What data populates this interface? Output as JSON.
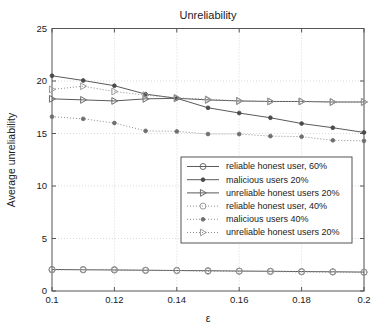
{
  "chart_data": {
    "type": "line",
    "title": "Unreliability",
    "xlabel": "ε",
    "ylabel": "Average unreliability",
    "xlim": [
      0.1,
      0.2
    ],
    "ylim": [
      0,
      25
    ],
    "grid": true,
    "legend_position": "center-right",
    "x": [
      0.1,
      0.11,
      0.12,
      0.13,
      0.14,
      0.15,
      0.16,
      0.17,
      0.18,
      0.19,
      0.2
    ],
    "xticks": [
      "0.1",
      "0.12",
      "0.14",
      "0.16",
      "0.18",
      "0.2"
    ],
    "xtick_values": [
      0.1,
      0.12,
      0.14,
      0.16,
      0.18,
      0.2
    ],
    "yticks": [
      "0",
      "5",
      "10",
      "15",
      "20",
      "25"
    ],
    "ytick_values": [
      0,
      5,
      10,
      15,
      20,
      25
    ],
    "series": [
      {
        "name": "reliable honest user, 60%",
        "style": "solid",
        "marker": "circle-open",
        "values": [
          2.05,
          2.02,
          2.0,
          1.98,
          1.95,
          1.93,
          1.9,
          1.88,
          1.85,
          1.83,
          1.8
        ]
      },
      {
        "name": "malicious users 20%",
        "style": "solid",
        "marker": "circle-filled",
        "values": [
          20.5,
          20.05,
          19.55,
          18.75,
          18.35,
          17.45,
          16.95,
          16.5,
          15.95,
          15.55,
          15.1
        ]
      },
      {
        "name": "unreliable honest users 20%",
        "style": "solid",
        "marker": "triangle-right-open",
        "values": [
          18.3,
          18.2,
          18.1,
          18.3,
          18.35,
          18.2,
          18.1,
          18.05,
          18.05,
          18.0,
          18.0
        ]
      },
      {
        "name": "reliable honest user, 40%",
        "style": "dotted",
        "marker": "circle-open",
        "values": [
          2.0,
          2.05,
          2.05,
          1.95,
          1.95,
          1.88,
          1.88,
          1.85,
          1.82,
          1.8,
          1.78
        ]
      },
      {
        "name": "malicious users 40%",
        "style": "dotted",
        "marker": "circle-filled",
        "values": [
          16.6,
          16.4,
          16.0,
          15.25,
          15.2,
          14.95,
          14.95,
          14.75,
          14.7,
          14.35,
          14.3
        ]
      },
      {
        "name": "unreliable honest users 20%",
        "style": "dotted",
        "marker": "triangle-right-open",
        "values": [
          19.2,
          19.5,
          19.0,
          18.65,
          18.4,
          18.25,
          18.1,
          18.05,
          18.05,
          18.0,
          18.0
        ]
      }
    ]
  },
  "colors": {
    "axis": "#555555",
    "grid": "#c8c8c8",
    "solid_series": "#5a5a5a",
    "dotted_series": "#8d8d8d",
    "background": "#ffffff"
  }
}
